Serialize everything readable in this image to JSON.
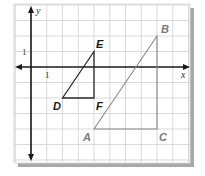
{
  "diagram": {
    "type": "coordinate-plane",
    "colors": {
      "background": "#ffffff",
      "card": "#ffffff",
      "grid": "#cfcfcf",
      "border": "#d8d8d8",
      "shadow": "#9a9a9a",
      "axis": "#1a1a1a",
      "triangle_small": "#2a2a2a",
      "triangle_large": "#8a8a8a",
      "label_small": "#1a1a1a",
      "label_large": "#7a7a7a"
    },
    "axes": {
      "x_label": "x",
      "y_label": "y",
      "x_tick_label": "1",
      "y_tick_label": "1",
      "x_range": [
        -1,
        10
      ],
      "y_range": [
        -6,
        4
      ]
    },
    "triangles": [
      {
        "name": "DEF",
        "vertices": [
          {
            "label": "D",
            "x": 2,
            "y": -2
          },
          {
            "label": "E",
            "x": 4,
            "y": 1
          },
          {
            "label": "F",
            "x": 4,
            "y": -2
          }
        ]
      },
      {
        "name": "ABC",
        "vertices": [
          {
            "label": "A",
            "x": 4,
            "y": -4
          },
          {
            "label": "B",
            "x": 8,
            "y": 2
          },
          {
            "label": "C",
            "x": 8,
            "y": -4
          }
        ]
      }
    ]
  }
}
